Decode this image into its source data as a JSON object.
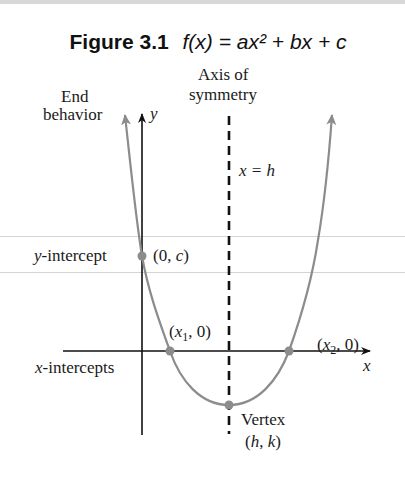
{
  "figure": {
    "number": "Figure 3.1",
    "equation": "f(x) = ax² + bx + c"
  },
  "labels": {
    "axis_of_symmetry_line1": "Axis of",
    "axis_of_symmetry_line2": "symmetry",
    "end_behavior_line1": "End",
    "end_behavior_line2": "behavior",
    "y_axis": "y",
    "x_axis": "x",
    "symmetry_eq": "x = h",
    "y_intercept": "y-intercept",
    "y_intercept_point": "(0, c)",
    "x1_point": "(x₁, 0)",
    "x2_point": "(x₂, 0)",
    "x_intercepts": "x-intercepts",
    "vertex": "Vertex",
    "vertex_point": "(h, k)"
  },
  "colors": {
    "curve": "#8c8c8c",
    "axes": "#111111",
    "points": "#8c8c8c"
  }
}
